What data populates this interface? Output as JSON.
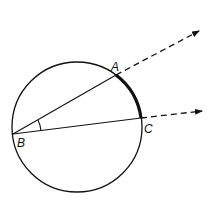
{
  "diagram": {
    "points": {
      "A": {
        "label": "A"
      },
      "B": {
        "label": "B"
      },
      "C": {
        "label": "C"
      }
    },
    "elements": [
      {
        "kind": "circle",
        "name": "circle"
      },
      {
        "kind": "ray",
        "name": "ray-BA",
        "from": "B",
        "through": "A",
        "extension": "dashed-arrow"
      },
      {
        "kind": "ray",
        "name": "ray-BC",
        "from": "B",
        "through": "C",
        "extension": "dashed-arrow"
      },
      {
        "kind": "arc",
        "name": "intercepted-arc-AC",
        "style": "bold"
      },
      {
        "kind": "angle-mark",
        "name": "angle-ABC"
      }
    ],
    "colors": {
      "stroke": "#111111",
      "background": "#ffffff"
    }
  }
}
